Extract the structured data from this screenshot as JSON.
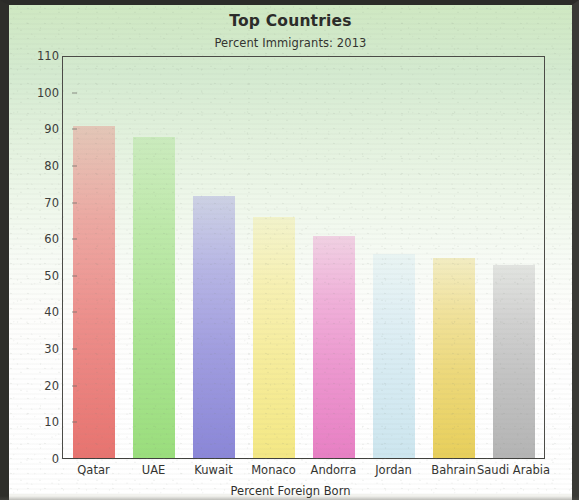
{
  "chart_data": {
    "type": "bar",
    "title": "Top Countries",
    "subtitle": "Percent Immigrants: 2013",
    "xlabel": "Percent Foreign Born",
    "ylabel": "",
    "ylim": [
      0,
      110
    ],
    "ytick_step": 10,
    "grid": false,
    "legend": "none",
    "categories": [
      "Qatar",
      "UAE",
      "Kuwait",
      "Monaco",
      "Andorra",
      "Jordan",
      "Bahrain",
      "Saudi Arabia"
    ],
    "values": [
      91,
      88,
      72,
      66,
      61,
      56,
      55,
      53
    ],
    "yticks": [
      "0",
      "10",
      "20",
      "30",
      "40",
      "50",
      "60",
      "70",
      "80",
      "90",
      "100",
      "110"
    ],
    "bar_colors": [
      "#e8736f",
      "#9ade7c",
      "#8a86d8",
      "#f4e884",
      "#e87fc4",
      "#cde6ef",
      "#e8cf5a",
      "#b4b4b4"
    ],
    "bars": [
      {
        "label": "Qatar",
        "value": 91,
        "color": "#e8736f"
      },
      {
        "label": "UAE",
        "value": 88,
        "color": "#9ade7c"
      },
      {
        "label": "Kuwait",
        "value": 72,
        "color": "#8a86d8"
      },
      {
        "label": "Monaco",
        "value": 66,
        "color": "#f4e884"
      },
      {
        "label": "Andorra",
        "value": 61,
        "color": "#e87fc4"
      },
      {
        "label": "Jordan",
        "value": 56,
        "color": "#cde6ef"
      },
      {
        "label": "Bahrain",
        "value": 55,
        "color": "#e8cf5a"
      },
      {
        "label": "Saudi Arabia",
        "value": 53,
        "color": "#b4b4b4"
      }
    ]
  },
  "style": {
    "background_top": "#cfe8c2",
    "background_bottom": "#ffffff",
    "axis_color": "#4a4a46",
    "text_color": "#2a2a28"
  }
}
